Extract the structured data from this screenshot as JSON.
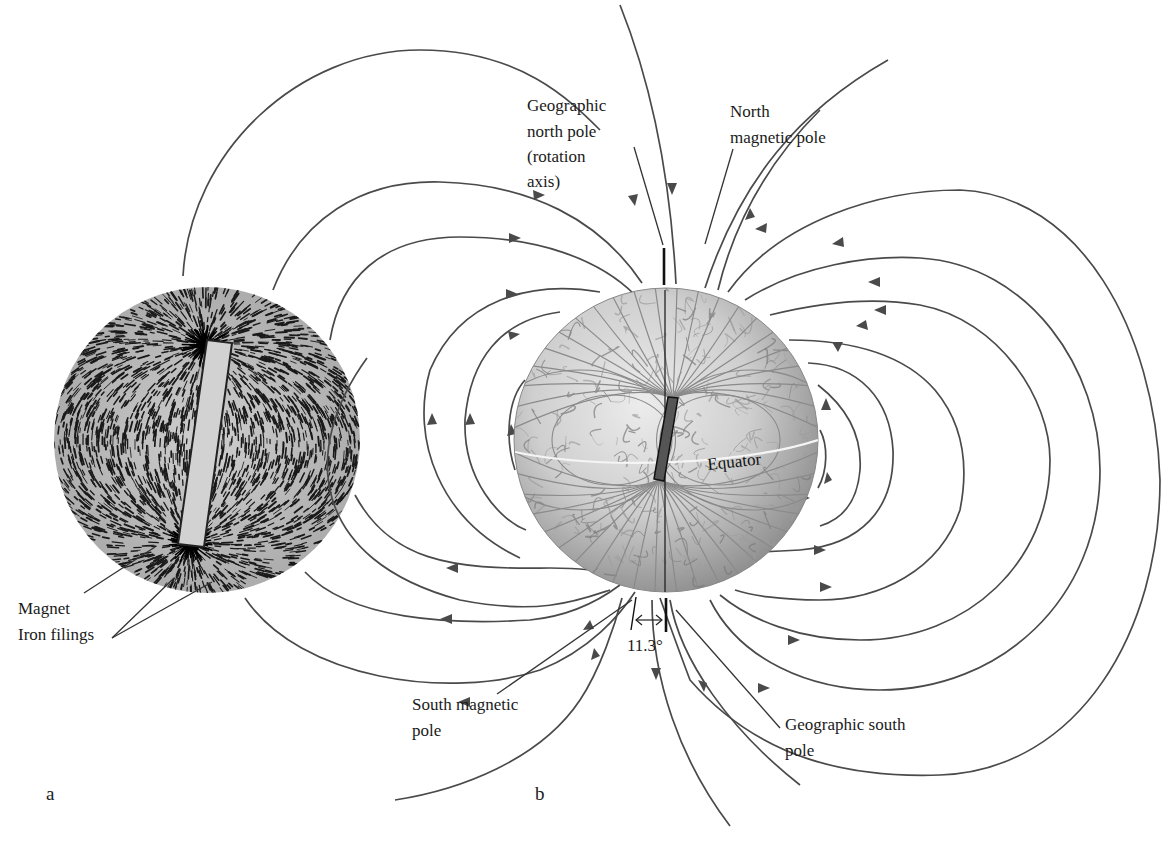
{
  "figure": {
    "panels": {
      "a": "a",
      "b": "b"
    },
    "panel_a": {
      "labels": {
        "magnet": "Magnet",
        "iron_filings": "Iron filings"
      }
    },
    "panel_b": {
      "labels": {
        "geographic_north_pole": [
          "Geographic",
          "north pole",
          "(rotation",
          "axis)"
        ],
        "north_magnetic_pole": [
          "North",
          "magnetic pole"
        ],
        "equator": "Equator",
        "angle": "11.3°",
        "south_magnetic_pole": [
          "South magnetic",
          "pole"
        ],
        "geographic_south_pole": [
          "Geographic south",
          "pole"
        ]
      },
      "magnetic_axis_tilt_degrees": 11.3
    },
    "colors": {
      "field_line": "#4a4a4a",
      "globe_base": "#c9c9c9",
      "filings_disc": "#bdbdbd",
      "magnet_bar": "#555555",
      "equator_line": "#f2f2f2"
    }
  }
}
